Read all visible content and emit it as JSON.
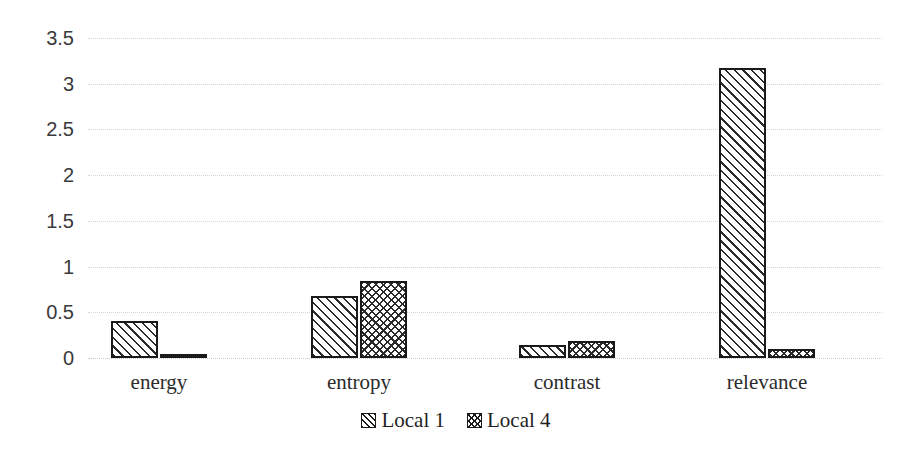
{
  "chart_data": {
    "type": "bar",
    "title": "",
    "xlabel": "",
    "ylabel": "",
    "categories": [
      "energy",
      "entropy",
      "contrast",
      "relevance"
    ],
    "series": [
      {
        "name": "Local 1",
        "values": [
          0.4,
          0.68,
          0.14,
          3.17
        ],
        "pattern": "diagonal-stripe"
      },
      {
        "name": "Local 4",
        "values": [
          0.04,
          0.84,
          0.19,
          0.1
        ],
        "pattern": "crosshatch"
      }
    ],
    "ylim": [
      0,
      3.5
    ],
    "y_ticks": [
      "0",
      "0.5",
      "1",
      "1.5",
      "2",
      "2.5",
      "3",
      "3.5"
    ],
    "y_tick_values": [
      0,
      0.5,
      1,
      1.5,
      2,
      2.5,
      3,
      3.5
    ],
    "grid": true,
    "grid_style": "dotted-horizontal",
    "legend_position": "bottom-center",
    "legend": [
      "Local 1",
      "Local 4"
    ],
    "colors": {
      "background": "#ffffff",
      "bar_outline": "#1a1a1a",
      "bar_fill": "#ffffff",
      "hatch": "#2a2a2a",
      "gridline": "#d6d6d6",
      "tick_text": "#3a3a3a",
      "label_text": "#2b2b2b"
    }
  },
  "layout": {
    "plot_top_px": 38,
    "plot_zero_px": 358,
    "px_per_unit": 91.43,
    "bar_width_px": 47,
    "group_centers_px": [
      159,
      359,
      567,
      767
    ]
  }
}
